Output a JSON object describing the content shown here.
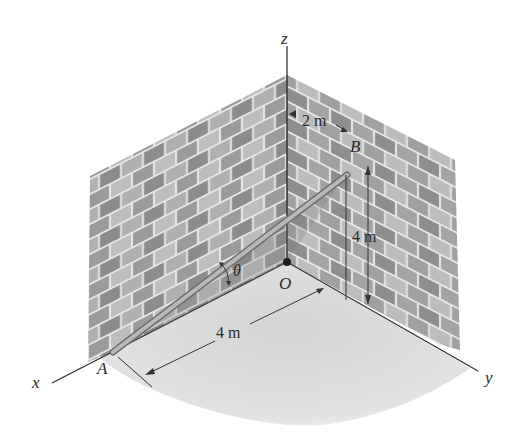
{
  "figure": {
    "type": "3D statics diagram",
    "colors": {
      "background": "#ffffff",
      "brick_dark": "#8a8a8a",
      "brick_light": "#b9b9b9",
      "mortar": "#e6e6e6",
      "floor": "#dcdcdc",
      "rod": "#9a9a9a",
      "lines": "#333333"
    }
  },
  "axes": {
    "x_label": "x",
    "y_label": "y",
    "z_label": "z",
    "origin_label": "O"
  },
  "points": {
    "A": "A",
    "B": "B"
  },
  "angle": {
    "symbol": "θ"
  },
  "dimensions": {
    "horizontal_offset": "2 m",
    "vertical_height": "4 m",
    "floor_distance": "4 m"
  }
}
